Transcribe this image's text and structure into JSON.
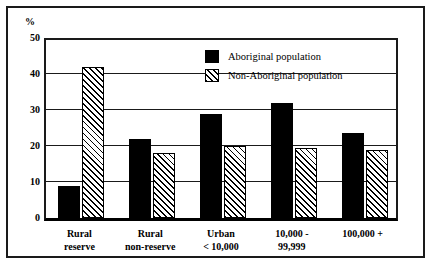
{
  "chart_data": {
    "type": "bar",
    "title": "",
    "subtitle": "",
    "xlabel": "",
    "ylabel": "%",
    "ylim": [
      0,
      50
    ],
    "yticks": [
      0,
      10,
      20,
      30,
      40,
      50
    ],
    "ytick_labels": [
      "0",
      "10",
      "20",
      "30",
      "40",
      "50"
    ],
    "grid": true,
    "legend_position": "top-center",
    "categories": [
      "Rural\nreserve",
      "Rural\nnon-reserve",
      "Urban\n< 10,000",
      "10,000 -\n99,999",
      "100,000 +"
    ],
    "series": [
      {
        "name": "Aboriginal population",
        "fill": "solid-black",
        "color": "#000000",
        "values": [
          9.0,
          22.0,
          29.0,
          32.0,
          23.5
        ]
      },
      {
        "name": "Non-Aboriginal population",
        "fill": "diagonal-hatch",
        "color": "#ffffff",
        "values": [
          42.0,
          18.0,
          20.0,
          19.5,
          19.0
        ]
      }
    ]
  },
  "legend": {
    "items": [
      {
        "label": "Aboriginal population",
        "swatch": "solid-black"
      },
      {
        "label": "Non-Aboriginal population",
        "swatch": "diagonal-hatch"
      }
    ]
  },
  "axes": {
    "y_unit_label": "%"
  }
}
